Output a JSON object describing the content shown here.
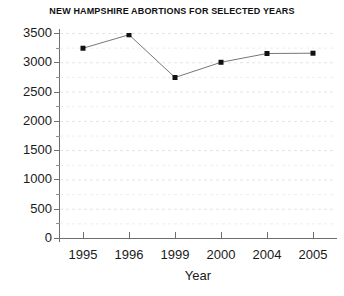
{
  "chart_data": {
    "type": "line",
    "title": "NEW HAMPSHIRE ABORTIONS FOR SELECTED YEARS",
    "xlabel": "Year",
    "ylabel": "",
    "categories": [
      "1995",
      "1996",
      "1999",
      "2000",
      "2004",
      "2005"
    ],
    "values": [
      3240,
      3470,
      2740,
      3000,
      3150,
      3155
    ],
    "series": [
      {
        "name": "Abortions",
        "values": [
          3240,
          3470,
          2740,
          3000,
          3150,
          3155
        ]
      }
    ],
    "ylim": [
      0,
      3500
    ],
    "yticks": [
      0,
      500,
      1000,
      1500,
      2000,
      2500,
      3000,
      3500
    ],
    "ytick_labels": [
      "0",
      "500",
      "1000",
      "1500",
      "2000",
      "2500",
      "3000",
      "3500"
    ],
    "xtick_labels": [
      "1995",
      "1996",
      "1999",
      "2000",
      "2004",
      "2005"
    ],
    "grid": true,
    "grid_style": "dashed-horizontal",
    "grid_color": "#e4e4e4",
    "legend": false,
    "legend_position": "none",
    "marker": "square",
    "marker_color": "#111111",
    "line_color": "#777777",
    "background_color": "#ffffff",
    "axis_color": "#6f6f6f"
  }
}
